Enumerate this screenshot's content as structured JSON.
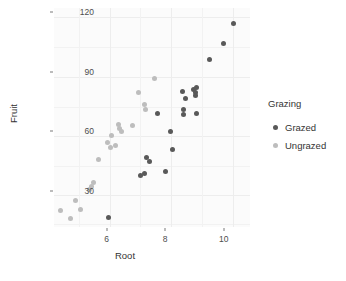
{
  "chart_data": {
    "type": "scatter",
    "title": "",
    "xlabel": "Root",
    "ylabel": "Fruit",
    "xlim": [
      4.2,
      10.9
    ],
    "ylim": [
      12,
      122
    ],
    "xticks": [
      6,
      8,
      10
    ],
    "yticks": [
      30,
      60,
      90,
      120
    ],
    "xtick_labels": [
      "6",
      "8",
      "10"
    ],
    "ytick_labels": [
      "30",
      "60",
      "90",
      "120"
    ],
    "grid": true,
    "legend": {
      "title": "Grazing",
      "position": "right",
      "entries": [
        {
          "label": "Grazed",
          "color": "#595959",
          "key": "grazed"
        },
        {
          "label": "Ungrazed",
          "color": "#bdbdbd",
          "key": "ungrazed"
        }
      ]
    },
    "series": [
      {
        "name": "Grazed",
        "color": "#595959",
        "points": [
          {
            "x": 6.08,
            "y": 17.0
          },
          {
            "x": 7.16,
            "y": 38.0
          },
          {
            "x": 7.29,
            "y": 38.9
          },
          {
            "x": 7.36,
            "y": 47.0
          },
          {
            "x": 7.48,
            "y": 45.0
          },
          {
            "x": 7.75,
            "y": 69.0
          },
          {
            "x": 8.02,
            "y": 40.0
          },
          {
            "x": 8.17,
            "y": 59.8
          },
          {
            "x": 8.25,
            "y": 51.0
          },
          {
            "x": 8.6,
            "y": 80.0
          },
          {
            "x": 8.62,
            "y": 71.0
          },
          {
            "x": 8.64,
            "y": 68.5
          },
          {
            "x": 8.68,
            "y": 76.5
          },
          {
            "x": 8.98,
            "y": 81.0
          },
          {
            "x": 9.02,
            "y": 79.5
          },
          {
            "x": 9.05,
            "y": 78.0
          },
          {
            "x": 9.06,
            "y": 82.0
          },
          {
            "x": 9.08,
            "y": 69.0
          },
          {
            "x": 9.52,
            "y": 96.0
          },
          {
            "x": 10.0,
            "y": 104.0
          },
          {
            "x": 10.35,
            "y": 114.0
          }
        ]
      },
      {
        "name": "Ungrazed",
        "color": "#bdbdbd",
        "points": [
          {
            "x": 4.43,
            "y": 20.5
          },
          {
            "x": 4.75,
            "y": 16.5
          },
          {
            "x": 4.95,
            "y": 25.5
          },
          {
            "x": 5.1,
            "y": 21.0
          },
          {
            "x": 5.42,
            "y": 31.0
          },
          {
            "x": 5.48,
            "y": 32.5
          },
          {
            "x": 5.54,
            "y": 34.5
          },
          {
            "x": 5.72,
            "y": 46.0
          },
          {
            "x": 6.04,
            "y": 54.5
          },
          {
            "x": 6.13,
            "y": 52.0
          },
          {
            "x": 6.18,
            "y": 58.0
          },
          {
            "x": 6.3,
            "y": 53.0
          },
          {
            "x": 6.4,
            "y": 63.5
          },
          {
            "x": 6.45,
            "y": 61.5
          },
          {
            "x": 6.5,
            "y": 60.0
          },
          {
            "x": 6.9,
            "y": 63.0
          },
          {
            "x": 7.1,
            "y": 79.5
          },
          {
            "x": 7.28,
            "y": 73.5
          },
          {
            "x": 7.32,
            "y": 71.0
          },
          {
            "x": 7.62,
            "y": 86.5
          }
        ]
      }
    ]
  },
  "axes": {
    "x_title": "Root",
    "y_title": "Fruit"
  }
}
